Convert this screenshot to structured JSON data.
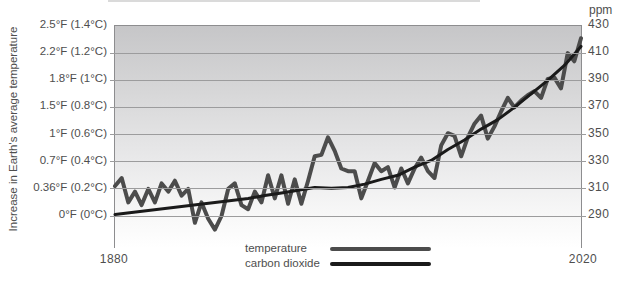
{
  "chart_data": {
    "type": "line",
    "y_axis_title": "Increase in Earth's average temperature",
    "right_axis_unit": "ppm",
    "left_tick_labels": [
      "2.5°F (1.4°C)",
      "2.2°F (1.2°C)",
      "1.8°F (1°C)",
      "1.5°F (0.8°C)",
      "1°F (0.6°C)",
      "0.7°F (0.4°C)",
      "0.36°F (0.2°C)",
      "0°F (0°C)"
    ],
    "right_tick_labels": [
      "430",
      "410",
      "390",
      "370",
      "350",
      "330",
      "310",
      "290"
    ],
    "x_tick_labels": [
      "1880",
      "2020"
    ],
    "x_range": [
      1880,
      2020
    ],
    "left_axis_c_ticks": [
      1.4,
      1.2,
      1.0,
      0.8,
      0.6,
      0.4,
      0.2,
      0
    ],
    "left_axis_f_ticks": [
      2.5,
      2.2,
      1.8,
      1.5,
      1.0,
      0.7,
      0.36,
      0
    ],
    "right_axis_ppm_ticks": [
      430,
      410,
      390,
      370,
      350,
      330,
      310,
      290
    ],
    "grid": true,
    "legend_position": "bottom-center",
    "colors": {
      "temperature": "#4c4c4c",
      "carbon_dioxide": "#1a1a1a",
      "gridline": "#9c9c9d",
      "axis": "#8d8d8f",
      "text": "#4e4e4e"
    },
    "series": [
      {
        "name": "temperature",
        "axis": "left",
        "unit": "°C anomaly",
        "color": "#4c4c4c",
        "x": [
          1880,
          1882,
          1884,
          1886,
          1888,
          1890,
          1892,
          1894,
          1896,
          1898,
          1900,
          1902,
          1904,
          1906,
          1908,
          1910,
          1912,
          1914,
          1916,
          1918,
          1920,
          1922,
          1924,
          1926,
          1928,
          1930,
          1932,
          1934,
          1936,
          1938,
          1940,
          1942,
          1944,
          1946,
          1948,
          1950,
          1952,
          1954,
          1956,
          1958,
          1960,
          1962,
          1964,
          1966,
          1968,
          1970,
          1972,
          1974,
          1976,
          1978,
          1980,
          1982,
          1984,
          1986,
          1988,
          1990,
          1992,
          1994,
          1996,
          1998,
          2000,
          2002,
          2004,
          2006,
          2008,
          2010,
          2012,
          2014,
          2016,
          2018,
          2020
        ],
        "values": [
          0.22,
          0.28,
          0.1,
          0.18,
          0.08,
          0.2,
          0.1,
          0.24,
          0.18,
          0.26,
          0.15,
          0.2,
          -0.05,
          0.1,
          -0.02,
          -0.1,
          0.0,
          0.2,
          0.24,
          0.08,
          0.05,
          0.18,
          0.1,
          0.3,
          0.13,
          0.3,
          0.09,
          0.27,
          0.09,
          0.26,
          0.44,
          0.45,
          0.58,
          0.48,
          0.35,
          0.33,
          0.33,
          0.13,
          0.26,
          0.39,
          0.33,
          0.36,
          0.21,
          0.35,
          0.24,
          0.35,
          0.43,
          0.33,
          0.28,
          0.52,
          0.61,
          0.59,
          0.44,
          0.58,
          0.68,
          0.74,
          0.57,
          0.66,
          0.77,
          0.87,
          0.8,
          0.85,
          0.89,
          0.92,
          0.87,
          1.01,
          1.02,
          0.94,
          1.2,
          1.14,
          1.31
        ]
      },
      {
        "name": "carbon dioxide",
        "axis": "right",
        "unit": "ppm",
        "color": "#1a1a1a",
        "x": [
          1880,
          1885,
          1890,
          1895,
          1900,
          1905,
          1910,
          1915,
          1920,
          1925,
          1930,
          1935,
          1940,
          1945,
          1950,
          1955,
          1960,
          1965,
          1970,
          1975,
          1980,
          1985,
          1990,
          1995,
          2000,
          2005,
          2010,
          2015,
          2020
        ],
        "values": [
          291,
          292.5,
          294,
          295.5,
          297,
          298.5,
          300,
          301.5,
          303,
          305,
          307,
          309,
          311,
          310.5,
          311,
          313.5,
          317,
          320,
          326,
          331,
          339,
          346,
          354,
          361,
          370,
          380,
          390,
          401,
          415
        ]
      }
    ]
  }
}
